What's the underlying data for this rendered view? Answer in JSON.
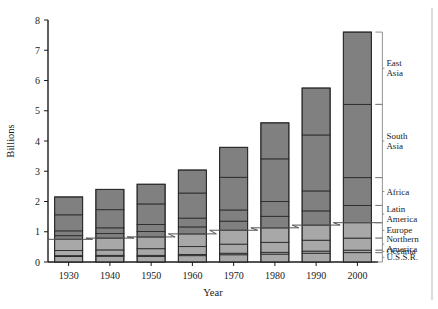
{
  "chart_data": {
    "type": "bar",
    "stacked": true,
    "title": "",
    "subtitle": "",
    "xlabel": "Year",
    "ylabel": "Billions",
    "categories": [
      "1930",
      "1940",
      "1950",
      "1960",
      "1970",
      "1980",
      "1990",
      "2000"
    ],
    "ylim": [
      0,
      8
    ],
    "ytick_values": [
      0,
      1,
      2,
      3,
      4,
      5,
      6,
      7,
      8
    ],
    "ytick_labels": [
      "0",
      "1",
      "2",
      "3",
      "4",
      "5",
      "6",
      "7",
      "8"
    ],
    "grid": false,
    "legend_position": "right-outside-bracket",
    "totals": [
      2.15,
      2.4,
      2.57,
      3.04,
      3.79,
      4.6,
      5.75,
      7.6
    ],
    "series": [
      {
        "name": "U.S.S.R.",
        "values": [
          0.18,
          0.19,
          0.18,
          0.21,
          0.24,
          0.26,
          0.29,
          0.31
        ]
      },
      {
        "name": "Oceania",
        "values": [
          0.03,
          0.03,
          0.04,
          0.04,
          0.05,
          0.06,
          0.07,
          0.08
        ]
      },
      {
        "name": "Northern America",
        "values": [
          0.17,
          0.18,
          0.22,
          0.26,
          0.3,
          0.33,
          0.36,
          0.4
        ]
      },
      {
        "name": "Europe",
        "values": [
          0.37,
          0.39,
          0.39,
          0.42,
          0.46,
          0.48,
          0.5,
          0.51
        ]
      },
      {
        "name": "Latin America",
        "values": [
          0.12,
          0.15,
          0.18,
          0.23,
          0.3,
          0.38,
          0.47,
          0.57
        ]
      },
      {
        "name": "Africa",
        "values": [
          0.16,
          0.19,
          0.23,
          0.29,
          0.37,
          0.49,
          0.66,
          0.92
        ]
      },
      {
        "name": "South Asia",
        "values": [
          0.53,
          0.6,
          0.68,
          0.83,
          1.08,
          1.41,
          1.85,
          2.42
        ]
      },
      {
        "name": "East Asia",
        "values": [
          0.59,
          0.67,
          0.65,
          0.76,
          0.99,
          1.19,
          1.55,
          2.39
        ]
      }
    ],
    "legend_entries": [
      {
        "label": "East Asia",
        "lines": [
          "East",
          "Asia"
        ]
      },
      {
        "label": "South Asia",
        "lines": [
          "South",
          "Asia"
        ]
      },
      {
        "label": "Africa",
        "lines": [
          "Africa"
        ]
      },
      {
        "label": "Latin America",
        "lines": [
          "Latin",
          "America"
        ]
      },
      {
        "label": "Europe",
        "lines": [
          "Europe"
        ]
      },
      {
        "label": "Northern America",
        "lines": [
          "Northern",
          "America"
        ]
      },
      {
        "label": "Oceania",
        "lines": [
          "Oceania"
        ]
      },
      {
        "label": "U.S.S.R.",
        "lines": [
          "U.S.S.R."
        ]
      }
    ],
    "annotations": [
      {
        "name": "developed-developing-step-line",
        "description": "stepped line across bars marking boundary between developed and developing region groups"
      }
    ],
    "colors": {
      "segment_dark": "#808080",
      "segment_light": "#a8a8a8",
      "segment_edge": "#2b2b2b",
      "axis": "#1a1a1a",
      "step_line": "#555555",
      "bracket": "#777777",
      "background": "#ffffff"
    }
  }
}
